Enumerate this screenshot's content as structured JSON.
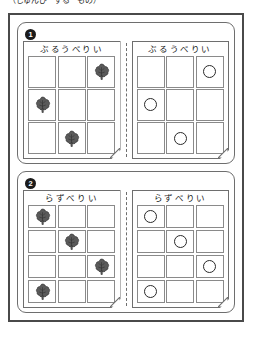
{
  "caption": "（じゅんび　する　もの）",
  "page": {
    "background_color": "#ffffff",
    "frame_color": "#4a4a4a",
    "panel_border_color": "#6e6e6e",
    "cell_border_color": "#8a8a8a",
    "token_color": "#2a2a2a",
    "badge_color": "#1b1b1b"
  },
  "panels": [
    {
      "number": "1",
      "badge_label": "1",
      "cards": [
        {
          "title": "ぶるうべりい",
          "token": "tree",
          "rows": 3,
          "cols": 3,
          "filled": [
            [
              false,
              false,
              true
            ],
            [
              true,
              false,
              false
            ],
            [
              false,
              true,
              false
            ]
          ]
        },
        {
          "title": "ぶるうべりい",
          "token": "circle",
          "rows": 3,
          "cols": 3,
          "filled": [
            [
              false,
              false,
              true
            ],
            [
              true,
              false,
              false
            ],
            [
              false,
              true,
              false
            ]
          ]
        }
      ]
    },
    {
      "number": "2",
      "badge_label": "2",
      "cards": [
        {
          "title": "らずべりい",
          "token": "tree",
          "rows": 4,
          "cols": 3,
          "filled": [
            [
              true,
              false,
              false
            ],
            [
              false,
              true,
              false
            ],
            [
              false,
              false,
              true
            ],
            [
              true,
              false,
              false
            ]
          ]
        },
        {
          "title": "らずべりい",
          "token": "circle",
          "rows": 4,
          "cols": 3,
          "filled": [
            [
              true,
              false,
              false
            ],
            [
              false,
              true,
              false
            ],
            [
              false,
              false,
              true
            ],
            [
              true,
              false,
              false
            ]
          ]
        }
      ]
    }
  ],
  "icons": {
    "tree": "tree-icon",
    "circle": "circle-token-icon",
    "dogear": "folded-corner-icon"
  }
}
